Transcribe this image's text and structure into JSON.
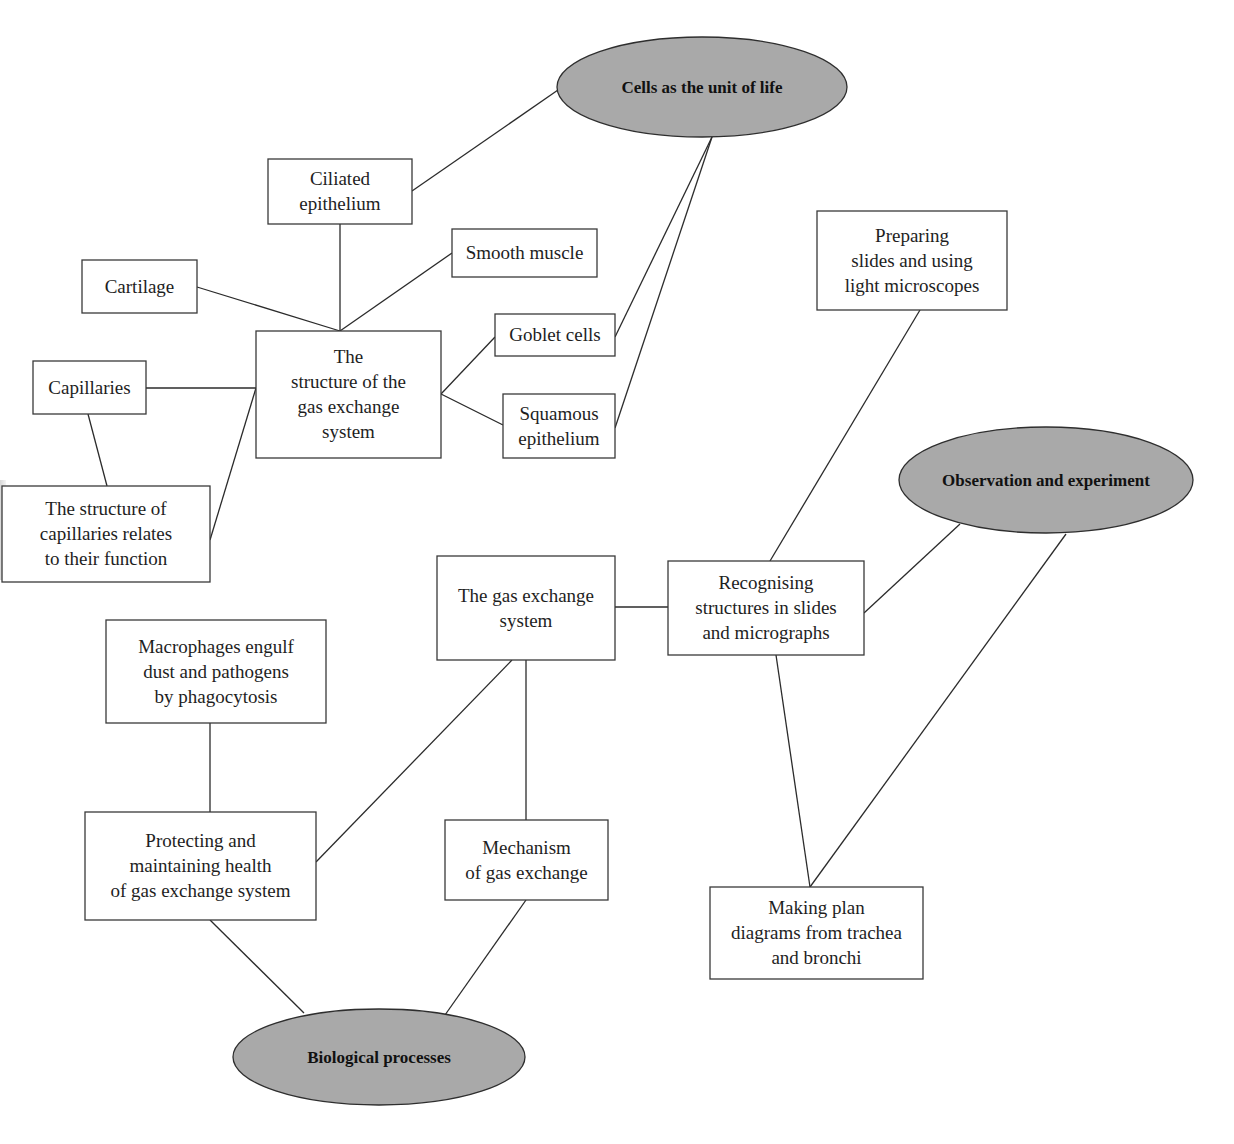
{
  "diagram": {
    "type": "concept-map",
    "central_themes": [
      {
        "id": "cells",
        "label": "Cells as the unit of life"
      },
      {
        "id": "observation",
        "label": "Observation and experiment"
      },
      {
        "id": "biological",
        "label": "Biological processes"
      }
    ],
    "concepts": [
      {
        "id": "ciliated",
        "lines": [
          "Ciliated",
          "epithelium"
        ]
      },
      {
        "id": "smooth",
        "lines": [
          "Smooth muscle"
        ]
      },
      {
        "id": "cartilage",
        "lines": [
          "Cartilage"
        ]
      },
      {
        "id": "goblet",
        "lines": [
          "Goblet cells"
        ]
      },
      {
        "id": "squamous",
        "lines": [
          "Squamous",
          "epithelium"
        ]
      },
      {
        "id": "structure",
        "lines": [
          "The",
          "structure of the",
          "gas exchange",
          "system"
        ]
      },
      {
        "id": "capillaries",
        "lines": [
          "Capillaries"
        ]
      },
      {
        "id": "capfunc",
        "lines": [
          "The structure of",
          "capillaries relates",
          "to their function"
        ]
      },
      {
        "id": "preparing",
        "lines": [
          "Preparing",
          "slides and using",
          "light microscopes"
        ]
      },
      {
        "id": "gassys",
        "lines": [
          "The gas exchange",
          "system"
        ]
      },
      {
        "id": "recognising",
        "lines": [
          "Recognising",
          "structures in slides",
          "and micrographs"
        ]
      },
      {
        "id": "macrophages",
        "lines": [
          "Macrophages engulf",
          "dust and pathogens",
          "by phagocytosis"
        ]
      },
      {
        "id": "protecting",
        "lines": [
          "Protecting and",
          "maintaining health",
          "of gas exchange system"
        ]
      },
      {
        "id": "mechanism",
        "lines": [
          "Mechanism",
          "of gas exchange"
        ]
      },
      {
        "id": "plan",
        "lines": [
          "Making plan",
          "diagrams from trachea",
          "and bronchi"
        ]
      }
    ],
    "connections": [
      [
        "ciliated",
        "cells"
      ],
      [
        "ciliated",
        "structure"
      ],
      [
        "cartilage",
        "structure"
      ],
      [
        "smooth",
        "structure"
      ],
      [
        "goblet",
        "structure"
      ],
      [
        "squamous",
        "structure"
      ],
      [
        "goblet",
        "cells"
      ],
      [
        "squamous",
        "cells"
      ],
      [
        "capillaries",
        "structure"
      ],
      [
        "capfunc",
        "structure"
      ],
      [
        "capillaries",
        "capfunc"
      ],
      [
        "preparing",
        "recognising"
      ],
      [
        "gassys",
        "recognising"
      ],
      [
        "recognising",
        "observation"
      ],
      [
        "observation",
        "plan"
      ],
      [
        "recognising",
        "plan"
      ],
      [
        "gassys",
        "protecting"
      ],
      [
        "gassys",
        "mechanism"
      ],
      [
        "macrophages",
        "protecting"
      ],
      [
        "protecting",
        "biological"
      ],
      [
        "mechanism",
        "biological"
      ]
    ]
  }
}
